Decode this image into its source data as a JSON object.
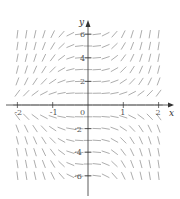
{
  "diagram": {
    "type": "slope_field",
    "equation_form": "dy/dx = x^2 * y",
    "axes": {
      "x_label": "x",
      "y_label": "y",
      "x_ticks": [
        {
          "value": -2,
          "label": "-2"
        },
        {
          "value": -1,
          "label": "-1"
        },
        {
          "value": 0,
          "label": "0"
        },
        {
          "value": 1,
          "label": "1"
        },
        {
          "value": 2,
          "label": "2"
        }
      ],
      "y_ticks": [
        {
          "value": 6,
          "label": "6"
        },
        {
          "value": 4,
          "label": "4"
        },
        {
          "value": 2,
          "label": "2"
        },
        {
          "value": -2,
          "label": "-2"
        },
        {
          "value": -4,
          "label": "-4"
        },
        {
          "value": -6,
          "label": "-6"
        }
      ],
      "x_range": [
        -2,
        2
      ],
      "y_range": [
        -6,
        6
      ]
    },
    "grid": {
      "x_step": 0.25,
      "y_step": 1
    },
    "colors": {
      "axis": "#333333",
      "segment": "#8a8a8a",
      "label": "#555555"
    }
  }
}
